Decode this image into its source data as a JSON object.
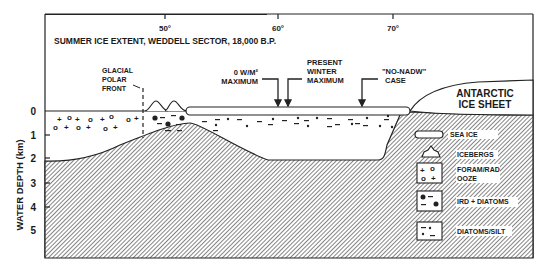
{
  "title": "SUMMER ICE EXTENT, WEDDELL SECTOR, 18,000 B.P.",
  "y_axis": {
    "label": "WATER DEPTH (km)",
    "ticks": [
      "0",
      "1",
      "2",
      "3",
      "4",
      "5"
    ]
  },
  "x_axis": {
    "ticks": [
      "50°",
      "60°",
      "70°"
    ]
  },
  "annotations": {
    "glacial_polar_front": [
      "GLACIAL",
      "POLAR",
      "FRONT"
    ],
    "zero_wm2": [
      "0 W/M²",
      "MAXIMUM"
    ],
    "present_winter": [
      "PRESENT",
      "WINTER",
      "MAXIMUM"
    ],
    "no_nadw": [
      "\"NO-NADW\"",
      "CASE"
    ],
    "ice_sheet": [
      "ANTARCTIC",
      "ICE SHEET"
    ]
  },
  "legend": {
    "items": [
      {
        "symbol": "sea-ice",
        "label": "SEA ICE"
      },
      {
        "symbol": "iceberg",
        "label": "ICEBERGS"
      },
      {
        "symbol": "foram-rad",
        "label": "FORAM/RAD",
        "label2": "OOZE"
      },
      {
        "symbol": "ird-diatoms",
        "label": "IRD + DIATOMS"
      },
      {
        "symbol": "diatoms-silt",
        "label": "DIATOMS/SILT"
      }
    ]
  }
}
